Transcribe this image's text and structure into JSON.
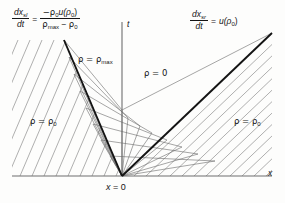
{
  "figure": {
    "kind": "characteristics-diagram",
    "domain": "x-t plane traffic flow shock diagram",
    "background_color": "#fdfdfc",
    "line_color": "#1a1a1a",
    "axis_color": "#6e6e6e",
    "hatch_color": "#7a7a7a"
  },
  "left_formula": {
    "lhs_num": "dx",
    "lhs_num_sub": "sl",
    "lhs_den": "dt",
    "equals": "=",
    "rhs_num": "−ρ",
    "rhs_num_sub": "0",
    "rhs_num_tail": "u(ρ",
    "rhs_num_tail_sub": "0",
    "rhs_num_tail_end": ")",
    "rhs_den_a": "ρ",
    "rhs_den_a_sub": "max",
    "rhs_den_minus": "−",
    "rhs_den_b": "ρ",
    "rhs_den_b_sub": "0",
    "plain": "dx_sl/dt = -rho_0 u(rho_0) / (rho_max - rho_0)"
  },
  "right_formula": {
    "lhs_num": "dx",
    "lhs_num_sub": "sr",
    "lhs_den": "dt",
    "equals": "=",
    "rhs": "u(ρ",
    "rhs_sub": "0",
    "rhs_end": ")",
    "plain": "dx_sr/dt = u(rho_0)"
  },
  "region_labels": [
    {
      "name": "rho-max-label",
      "prefix": "ρ = ρ",
      "sub": "max",
      "x": 78,
      "y": 58
    },
    {
      "name": "rho-zero-label",
      "prefix": "ρ = 0",
      "sub": "",
      "x": 142,
      "y": 72
    },
    {
      "name": "rho-0-left",
      "prefix": "ρ = ρ",
      "sub": "0",
      "x": 35,
      "y": 120
    },
    {
      "name": "rho-0-right",
      "prefix": "ρ = ρ",
      "sub": "0",
      "x": 236,
      "y": 120
    }
  ],
  "axis_labels": {
    "t": "t",
    "x": "x",
    "origin": "x = 0"
  },
  "geometry": {
    "origin_x": 122,
    "origin_y": 176,
    "t_axis_top": 22,
    "x_axis_y": 176,
    "x_axis_left": 12,
    "x_axis_right": 272,
    "left_shock_end_x": 64,
    "left_shock_end_y": 40,
    "right_shock_end_x": 272,
    "right_shock_end_y": 33,
    "fan_lines": 9,
    "left_hatch_lines": 19,
    "right_hatch_lines": 19
  }
}
